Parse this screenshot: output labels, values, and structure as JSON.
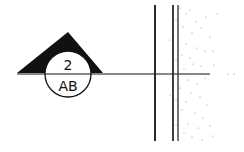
{
  "drawing": {
    "type": "section-marker",
    "marker": {
      "detail_number": "2",
      "sheet_number": "AB"
    },
    "colors": {
      "ink": "#111111",
      "wall_line": "#2a2a2a",
      "stipple": "#888888",
      "background": "#ffffff"
    }
  }
}
